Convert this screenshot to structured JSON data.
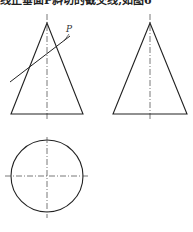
{
  "caption": "线正垂面P斜切的截交线,如图6",
  "label_p": "P",
  "colors": {
    "line": "#222222",
    "centerline": "#555555"
  },
  "views": [
    {
      "name": "front-view",
      "shape": "triangle",
      "apex": [
        47,
        23
      ],
      "base_left": [
        11,
        114
      ],
      "base_right": [
        83,
        114
      ]
    },
    {
      "name": "side-view",
      "shape": "triangle",
      "apex": [
        150,
        23
      ],
      "base_left": [
        113,
        114
      ],
      "base_right": [
        187,
        114
      ]
    },
    {
      "name": "top-view",
      "shape": "circle",
      "center": [
        47,
        176
      ],
      "radius": 36
    }
  ],
  "cutting_plane": {
    "start": [
      10,
      82
    ],
    "end": [
      70,
      36
    ]
  }
}
